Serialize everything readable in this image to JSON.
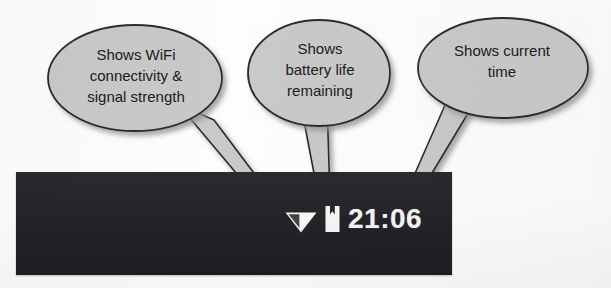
{
  "figure": {
    "background_color": "#fdfdfb",
    "bubble_fill": "#c9c9c9",
    "bubble_stroke": "#2a2a2a",
    "statusbar_color": "#26262a",
    "icon_color": "#f4f4f4"
  },
  "status_bar": {
    "wifi_icon": "wifi-signal-icon",
    "battery_icon": "battery-icon",
    "clock": "21:06"
  },
  "callouts": [
    {
      "id": "wifi",
      "text": "Shows WiFi\nconnectivity &\nsignal strength",
      "target": "wifi-signal-icon"
    },
    {
      "id": "battery",
      "text": "Shows\nbattery life\nremaining",
      "target": "battery-icon"
    },
    {
      "id": "clock",
      "text": "Shows current\ntime",
      "target": "clock-label"
    }
  ]
}
